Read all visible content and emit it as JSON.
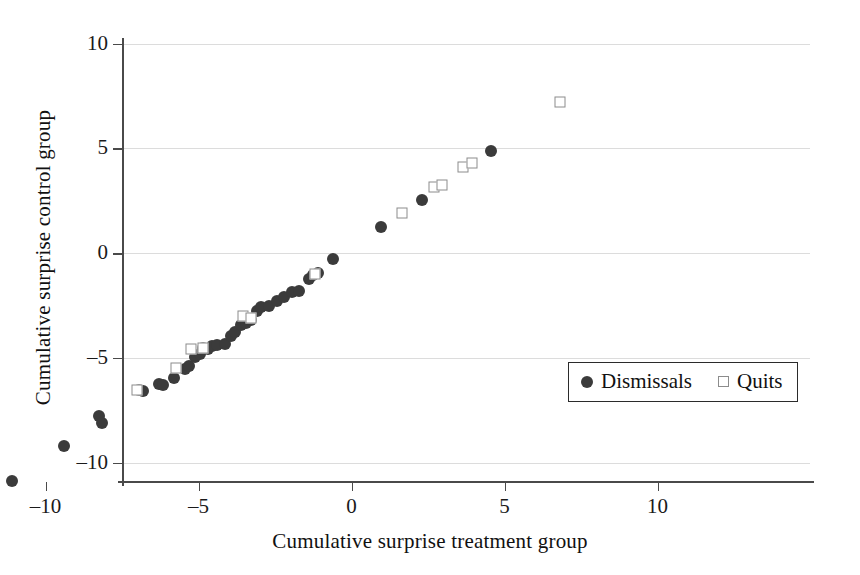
{
  "chart_data": {
    "type": "scatter",
    "title": "",
    "xlabel": "Cumulative surprise treatment group",
    "ylabel": "Cumulative surprise control group",
    "xlim": [
      -12.2,
      11.0
    ],
    "ylim": [
      -11.8,
      10.8
    ],
    "xticks": [
      -10,
      -5,
      0,
      5,
      10
    ],
    "yticks": [
      -10,
      -5,
      0,
      5,
      10
    ],
    "xtick_labels": [
      "–10",
      "–5",
      "0",
      "5",
      "10"
    ],
    "ytick_labels": [
      "–10",
      "–5",
      "0",
      "5",
      "10"
    ],
    "grid": "horizontal",
    "legend_position": "center-right",
    "series": [
      {
        "name": "Dismissals",
        "marker": "filled-circle",
        "color": "#3b3b3b",
        "points": [
          [
            -11.1,
            -10.9
          ],
          [
            -9.4,
            -9.2
          ],
          [
            -8.25,
            -7.8
          ],
          [
            -8.15,
            -8.1
          ],
          [
            -6.95,
            -6.55
          ],
          [
            -6.8,
            -6.6
          ],
          [
            -6.3,
            -6.25
          ],
          [
            -6.15,
            -6.3
          ],
          [
            -5.8,
            -5.95
          ],
          [
            -5.45,
            -5.55
          ],
          [
            -5.3,
            -5.4
          ],
          [
            -5.1,
            -4.95
          ],
          [
            -4.95,
            -4.8
          ],
          [
            -4.85,
            -4.55
          ],
          [
            -4.7,
            -4.6
          ],
          [
            -4.55,
            -4.45
          ],
          [
            -4.4,
            -4.4
          ],
          [
            -4.15,
            -4.35
          ],
          [
            -3.95,
            -3.95
          ],
          [
            -3.8,
            -3.75
          ],
          [
            -3.6,
            -3.45
          ],
          [
            -3.45,
            -3.35
          ],
          [
            -3.3,
            -3.2
          ],
          [
            -3.1,
            -2.75
          ],
          [
            -2.95,
            -2.6
          ],
          [
            -2.7,
            -2.55
          ],
          [
            -2.45,
            -2.3
          ],
          [
            -2.2,
            -2.1
          ],
          [
            -1.95,
            -1.85
          ],
          [
            -1.7,
            -1.8
          ],
          [
            -1.4,
            -1.25
          ],
          [
            -1.25,
            -1.05
          ],
          [
            -1.1,
            -0.95
          ],
          [
            -0.6,
            -0.3
          ],
          [
            0.95,
            1.25
          ],
          [
            2.3,
            2.55
          ],
          [
            4.55,
            4.85
          ]
        ]
      },
      {
        "name": "Quits",
        "marker": "open-square",
        "color": "#8c8c8c",
        "points": [
          [
            -7.0,
            -6.55
          ],
          [
            -5.75,
            -5.5
          ],
          [
            -5.25,
            -4.6
          ],
          [
            -4.85,
            -4.55
          ],
          [
            -3.55,
            -3.0
          ],
          [
            -3.3,
            -3.1
          ],
          [
            -1.2,
            -1.0
          ],
          [
            1.65,
            1.9
          ],
          [
            2.7,
            3.15
          ],
          [
            2.95,
            3.25
          ],
          [
            3.65,
            4.1
          ],
          [
            3.95,
            4.3
          ],
          [
            6.8,
            7.2
          ]
        ]
      }
    ]
  },
  "legend": {
    "entries": [
      {
        "label": "Dismissals",
        "marker": "filled-circle"
      },
      {
        "label": "Quits",
        "marker": "open-square"
      }
    ]
  },
  "colors": {
    "dismissals": "#3b3b3b",
    "quits": "#8c8c8c",
    "axis": "#4a4a4a",
    "grid": "#dcdcdc",
    "text": "#111111"
  }
}
